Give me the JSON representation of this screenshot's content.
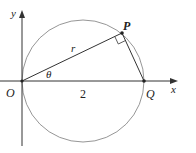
{
  "diagram": {
    "type": "geometry",
    "axes": {
      "x_label": "x",
      "y_label": "y"
    },
    "points": {
      "origin": "O",
      "p": "P",
      "q": "Q"
    },
    "labels": {
      "radius_segment": "r",
      "angle": "θ",
      "length_oq": "2"
    },
    "colors": {
      "stroke": "#333333",
      "circle": "#888888",
      "text": "#222222"
    }
  }
}
